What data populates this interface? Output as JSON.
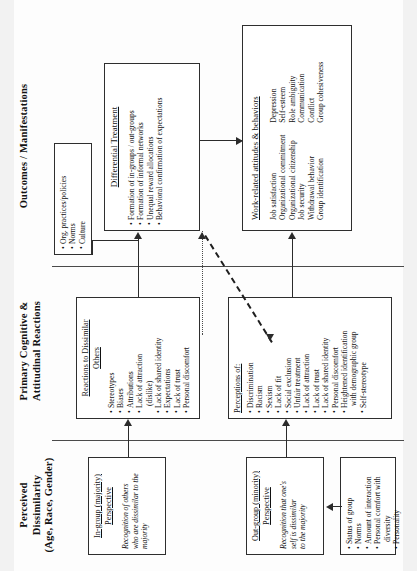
{
  "figure": {
    "orientation": "rotated-90-ccw",
    "headers": [
      {
        "id": "col1",
        "line1": "Perceived",
        "line2": "Dissimilarity",
        "line3": "(Age, Race, Gender)"
      },
      {
        "id": "col2",
        "line1": "Primary Cognitive &",
        "line2": "Attitudinal Reactions",
        "line3": ""
      },
      {
        "id": "col3",
        "line1": "Outcomes / Manifestations",
        "line2": "",
        "line3": ""
      }
    ]
  },
  "boxes": {
    "ingroup": {
      "title_line1": "In-group (majority)",
      "title_line2": "Perspective",
      "italic_line1": "Recognition of others",
      "italic_line2": "who are dissimilar to the",
      "italic_line3": "majority"
    },
    "outgroup": {
      "title_line1": "Out-group (minority)",
      "title_line2": "Perspective",
      "italic_line1": "Recognition that one's",
      "italic_line2": "self is dissimilar",
      "italic_line3": "to the majority"
    },
    "moderators": {
      "items": [
        "Status of group",
        "Norms",
        "Amount of interaction",
        "Personal comfort with",
        "diversity",
        "Personality"
      ],
      "bulleted": [
        true,
        true,
        true,
        true,
        false,
        true
      ]
    },
    "reactions": {
      "title_line1": "Reactions to Dissimilar",
      "title_line2": "Others",
      "items": [
        "Stereotypes",
        "Biases",
        "Attributions",
        "Lack of attraction",
        "(dislike)",
        "Lack of shared identity",
        "Expectations",
        "Lack of trust",
        "Personal discomfort"
      ],
      "bulleted": [
        true,
        true,
        true,
        true,
        false,
        true,
        true,
        true,
        true
      ]
    },
    "perceptions": {
      "title": "Perceptions of:",
      "items": [
        "Discrimination",
        "Racism",
        "Sexism",
        "Lack of fit",
        "Social exclusion",
        "Unfair treatment",
        "Lack of attraction",
        "Lack of trust",
        "Lack of shared identity",
        "Personal discomfort",
        "Heightened identification",
        "with demographic group",
        "Self-stereotype"
      ],
      "bulleted": [
        true,
        true,
        true,
        true,
        true,
        true,
        true,
        true,
        true,
        true,
        true,
        false,
        true
      ]
    },
    "org": {
      "items": [
        "Org. practices/policies",
        "Norms",
        "Culture"
      ]
    },
    "differential": {
      "title": "Differential Treatment",
      "items": [
        "Formation of in-groups / out-groups",
        "Formation of informal networks",
        "Unequal reward allocations",
        "Behavioral confirmation of expectations"
      ]
    },
    "workrelated": {
      "title": "Work-related attitudes & behaviors",
      "col1": [
        "Job satisfaction",
        "Organizational commitment",
        "Organizational citizenship",
        "Job security",
        "Withdrawal behavior",
        "Group identification"
      ],
      "col2": [
        "Depression",
        "Self-esteem",
        "Role ambiguity",
        "Communication",
        "Conflict",
        "Group cohesiveness"
      ]
    }
  }
}
